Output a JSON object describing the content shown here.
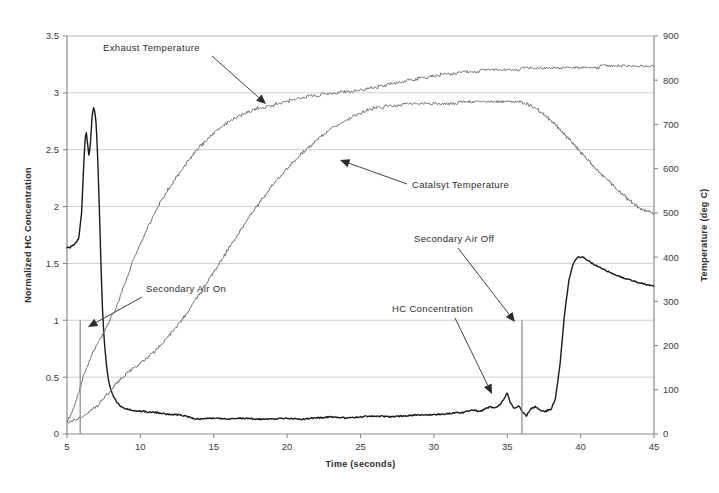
{
  "chart_data": {
    "type": "line",
    "title": "",
    "xlabel": "Time (seconds)",
    "ylabel": "Normalized HC Concentration",
    "y2label": "Temperature (deg C)",
    "xlim": [
      5,
      45
    ],
    "ylim": [
      0,
      3.5
    ],
    "y2lim": [
      0,
      900
    ],
    "xticks": [
      5,
      10,
      15,
      20,
      25,
      30,
      35,
      40,
      45
    ],
    "yticks": [
      0,
      0.5,
      1,
      1.5,
      2,
      2.5,
      3,
      3.5
    ],
    "y2ticks": [
      0,
      100,
      200,
      300,
      400,
      500,
      600,
      700,
      800,
      900
    ],
    "grid": "horizontal",
    "legend_position": "none",
    "series": [
      {
        "name": "HC Concentration",
        "axis": "left",
        "color": "#1a1a1a",
        "linewidth": 1.4,
        "x": [
          5.0,
          5.2,
          5.4,
          5.6,
          5.8,
          6.0,
          6.1,
          6.2,
          6.3,
          6.4,
          6.5,
          6.6,
          6.7,
          6.8,
          6.9,
          7.0,
          7.1,
          7.2,
          7.3,
          7.4,
          7.5,
          7.6,
          7.7,
          7.8,
          7.9,
          8.0,
          8.2,
          8.4,
          8.6,
          8.8,
          9.0,
          9.4,
          9.8,
          10.2,
          10.6,
          11.0,
          11.5,
          12.0,
          12.5,
          13.0,
          13.5,
          14.0,
          15.0,
          16.0,
          17.0,
          18.0,
          19.0,
          20.0,
          21.0,
          22.0,
          23.0,
          24.0,
          25.0,
          26.0,
          27.0,
          28.0,
          29.0,
          30.0,
          31.0,
          32.0,
          32.6,
          33.2,
          33.8,
          34.2,
          34.6,
          35.0,
          35.2,
          35.5,
          35.8,
          36.0,
          36.3,
          36.6,
          36.9,
          37.2,
          37.6,
          38.0,
          38.3,
          38.6,
          38.9,
          39.2,
          39.5,
          39.8,
          40.2,
          40.8,
          41.5,
          42.2,
          43.0,
          44.0,
          45.0
        ],
        "y": [
          1.64,
          1.64,
          1.66,
          1.68,
          1.72,
          1.95,
          2.25,
          2.52,
          2.68,
          2.55,
          2.44,
          2.56,
          2.78,
          2.87,
          2.84,
          2.7,
          2.4,
          2.0,
          1.55,
          1.15,
          0.9,
          0.72,
          0.6,
          0.5,
          0.43,
          0.38,
          0.32,
          0.28,
          0.25,
          0.23,
          0.22,
          0.21,
          0.2,
          0.2,
          0.19,
          0.19,
          0.18,
          0.17,
          0.17,
          0.16,
          0.14,
          0.13,
          0.14,
          0.13,
          0.14,
          0.13,
          0.13,
          0.14,
          0.13,
          0.14,
          0.15,
          0.14,
          0.15,
          0.16,
          0.15,
          0.16,
          0.17,
          0.17,
          0.18,
          0.19,
          0.21,
          0.2,
          0.24,
          0.23,
          0.27,
          0.36,
          0.28,
          0.22,
          0.25,
          0.2,
          0.16,
          0.22,
          0.24,
          0.21,
          0.2,
          0.22,
          0.32,
          0.62,
          1.05,
          1.35,
          1.5,
          1.56,
          1.55,
          1.5,
          1.45,
          1.41,
          1.37,
          1.33,
          1.3
        ]
      },
      {
        "name": "Exhaust Temperature",
        "axis": "right",
        "color": "#6f6f6f",
        "linewidth": 1.0,
        "x": [
          5.0,
          5.3,
          5.6,
          5.9,
          6.2,
          6.5,
          7.0,
          7.5,
          8.0,
          8.5,
          9.0,
          9.5,
          10.0,
          10.5,
          11.0,
          11.5,
          12.0,
          12.5,
          13.0,
          13.5,
          14.0,
          14.5,
          15.0,
          15.5,
          16.0,
          16.5,
          17.0,
          17.5,
          18.0,
          18.5,
          19.0,
          19.5,
          20.0,
          20.5,
          21.0,
          21.5,
          22.0,
          22.5,
          23.0,
          23.5,
          24.0,
          25.0,
          26.0,
          27.0,
          28.0,
          29.0,
          30.0,
          31.0,
          32.0,
          33.0,
          34.0,
          35.0,
          36.0,
          37.0,
          38.0,
          39.0,
          40.0,
          41.0,
          42.0,
          43.0,
          44.0,
          45.0
        ],
        "y": [
          28,
          45,
          70,
          105,
          140,
          165,
          200,
          230,
          262,
          300,
          345,
          390,
          430,
          468,
          502,
          532,
          558,
          583,
          606,
          628,
          648,
          665,
          680,
          694,
          706,
          716,
          724,
          730,
          736,
          740,
          744,
          748,
          752,
          757,
          761,
          764,
          766,
          768,
          770,
          772,
          774,
          778,
          784,
          791,
          798,
          804,
          810,
          815,
          818,
          821,
          823,
          824,
          826,
          827,
          828,
          829,
          830,
          830,
          831,
          831,
          832,
          832
        ]
      },
      {
        "name": "Catalsyt Temperature",
        "axis": "right",
        "color": "#6f6f6f",
        "linewidth": 1.0,
        "x": [
          5.0,
          5.5,
          6.0,
          6.5,
          7.0,
          7.5,
          8.0,
          8.5,
          9.0,
          9.5,
          10.0,
          10.5,
          11.0,
          11.5,
          12.0,
          12.5,
          13.0,
          13.5,
          14.0,
          14.5,
          15.0,
          15.5,
          16.0,
          16.5,
          17.0,
          17.5,
          18.0,
          18.5,
          19.0,
          19.5,
          20.0,
          20.5,
          21.0,
          21.5,
          22.0,
          22.5,
          23.0,
          23.5,
          24.0,
          24.5,
          25.0,
          25.5,
          26.0,
          26.5,
          27.0,
          27.5,
          28.0,
          28.5,
          29.0,
          30.0,
          31.0,
          32.0,
          33.0,
          34.0,
          35.0,
          35.5,
          36.0,
          36.5,
          37.0,
          37.5,
          38.0,
          38.5,
          39.0,
          39.5,
          40.0,
          40.5,
          41.0,
          41.5,
          42.0,
          42.5,
          43.0,
          43.5,
          44.0,
          44.5,
          45.0
        ],
        "y": [
          25,
          30,
          38,
          48,
          62,
          80,
          100,
          118,
          134,
          148,
          160,
          173,
          188,
          205,
          224,
          244,
          266,
          290,
          315,
          340,
          366,
          392,
          418,
          444,
          470,
          494,
          518,
          540,
          562,
          582,
          600,
          618,
          634,
          650,
          664,
          678,
          690,
          700,
          710,
          718,
          726,
          732,
          737,
          740,
          742,
          744,
          745,
          746,
          748,
          748,
          748,
          750,
          751,
          752,
          753,
          752,
          750,
          744,
          735,
          722,
          708,
          692,
          674,
          656,
          638,
          620,
          602,
          585,
          568,
          552,
          538,
          524,
          512,
          504,
          500
        ]
      }
    ],
    "annotations": [
      {
        "id": "exhaust-temperature",
        "text": "Exhaust Temperature",
        "text_x": 103,
        "text_y": 51,
        "arrow_from_x": 212,
        "arrow_from_y": 56,
        "arrow_to_x": 266,
        "arrow_to_y": 104
      },
      {
        "id": "catalsyt-temperature",
        "text": "Catalsyt Temperature",
        "text_x": 412,
        "text_y": 188,
        "arrow_from_x": 407,
        "arrow_from_y": 184,
        "arrow_to_x": 340,
        "arrow_to_y": 160
      },
      {
        "id": "secondary-air-on",
        "text": "Secondary Air On",
        "text_x": 146,
        "text_y": 292,
        "arrow_from_x": 142,
        "arrow_from_y": 297,
        "arrow_to_x": 88,
        "arrow_to_y": 327
      },
      {
        "id": "secondary-air-off",
        "text": "Secondary Air Off",
        "text_x": 414,
        "text_y": 242,
        "arrow_from_x": 458,
        "arrow_from_y": 248,
        "arrow_to_x": 515,
        "arrow_to_y": 322
      },
      {
        "id": "hc-concentration",
        "text": "HC Concentration",
        "text_x": 392,
        "text_y": 312,
        "arrow_from_x": 455,
        "arrow_from_y": 318,
        "arrow_to_x": 492,
        "arrow_to_y": 394
      }
    ],
    "markers": [
      {
        "id": "secondary-air-on-line",
        "x": 5.9,
        "y_top": 1.0,
        "y_bottom": 0
      },
      {
        "id": "secondary-air-off-line",
        "x": 36.0,
        "y_top": 1.0,
        "y_bottom": 0
      }
    ]
  },
  "colors": {
    "background": "#ffffff",
    "axis": "#8a8a8a",
    "grid": "#c9c9c9",
    "hc_line": "#1a1a1a",
    "temp_line": "#6f6f6f",
    "marker_line": "#8f8f8f",
    "text": "#2b2b2b"
  }
}
